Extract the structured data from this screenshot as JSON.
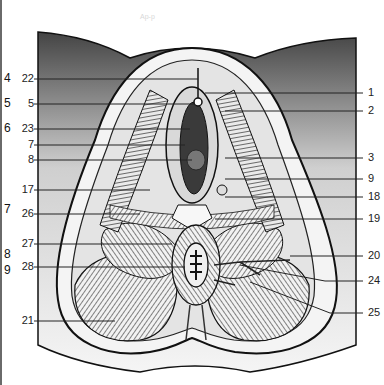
{
  "figure": {
    "faint_header": "Ap-p",
    "outer_left_labels": [
      {
        "text": "4",
        "y": 79
      },
      {
        "text": "5",
        "y": 104
      },
      {
        "text": "6",
        "y": 129
      },
      {
        "text": "7",
        "y": 210
      },
      {
        "text": "8",
        "y": 255
      },
      {
        "text": "9",
        "y": 271
      }
    ],
    "left_labels": [
      {
        "text": "22",
        "y": 79
      },
      {
        "text": "5",
        "y": 104
      },
      {
        "text": "23",
        "y": 129
      },
      {
        "text": "7",
        "y": 145
      },
      {
        "text": "8",
        "y": 160
      },
      {
        "text": "17",
        "y": 190
      },
      {
        "text": "26",
        "y": 214
      },
      {
        "text": "27",
        "y": 244
      },
      {
        "text": "28",
        "y": 267
      },
      {
        "text": "21",
        "y": 321
      }
    ],
    "right_labels": [
      {
        "text": "1",
        "y": 93
      },
      {
        "text": "2",
        "y": 111
      },
      {
        "text": "3",
        "y": 158
      },
      {
        "text": "9",
        "y": 179
      },
      {
        "text": "18",
        "y": 197
      },
      {
        "text": "19",
        "y": 219
      },
      {
        "text": "20",
        "y": 256
      },
      {
        "text": "24",
        "y": 281
      },
      {
        "text": "25",
        "y": 313
      }
    ],
    "colors": {
      "ink": "#111111",
      "paper": "#ffffff",
      "shade": "#8a8a8a"
    }
  }
}
